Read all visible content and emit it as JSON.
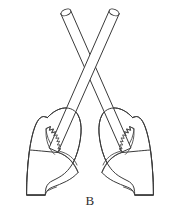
{
  "figure": {
    "caption": "B",
    "background_color": "#ffffff",
    "line_color": "#3a3a3a",
    "objects": [
      {
        "name": "left-stick",
        "type": "cylindrical-stick",
        "description": "Cylinder angled from upper-left down to lower-right, open elliptical top end",
        "top_end": "open ellipse",
        "orientation": "upper-left to lower-right"
      },
      {
        "name": "right-stick",
        "type": "cylindrical-stick",
        "description": "Cylinder angled from upper-right down to lower-left, open elliptical top end",
        "top_end": "open ellipse",
        "orientation": "upper-right to lower-left"
      },
      {
        "name": "left-hand",
        "type": "closed-fist",
        "description": "Left fist gripping the right-leaning stick, knuckles toward center"
      },
      {
        "name": "right-hand",
        "type": "closed-fist",
        "description": "Right fist gripping the left-leaning stick, knuckles toward center"
      }
    ],
    "cross_point": {
      "x": 90,
      "y": 78
    }
  }
}
